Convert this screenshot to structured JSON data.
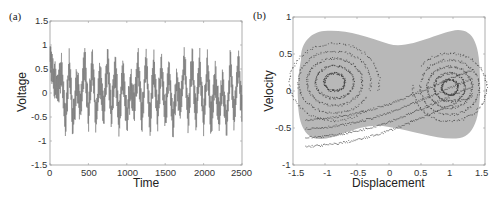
{
  "chart_data": [
    {
      "panel": "(a)",
      "type": "line",
      "title": "",
      "xlabel": "Time",
      "ylabel": "Voltage",
      "xlim": [
        0,
        2500
      ],
      "ylim": [
        -1.5,
        1.5
      ],
      "xticks": [
        "0",
        "500",
        "1000",
        "1500",
        "2000",
        "2500"
      ],
      "yticks": [
        "1.5",
        "1",
        "0.5",
        "0",
        "-0.5",
        "-1",
        "-1.5"
      ],
      "grid": false,
      "legend": null,
      "series": [
        {
          "name": "voltage",
          "color": "#555555",
          "values_are_representative": true,
          "description": "Dense chaotic oscillation, ~45 sharp spikes across 0–2500; values range roughly -0.9 to +0.95; initial transient near 1.0 at t≈0",
          "x": [
            0,
            50,
            100,
            150,
            200,
            250,
            300,
            350,
            400,
            450,
            500,
            550,
            600,
            650,
            700,
            750,
            800,
            850,
            900,
            950,
            1000,
            1050,
            1100,
            1150,
            1200,
            1250,
            1300,
            1350,
            1400,
            1450,
            1500,
            1550,
            1600,
            1650,
            1700,
            1750,
            1800,
            1850,
            1900,
            1950,
            2000,
            2050,
            2100,
            2150,
            2200,
            2250,
            2300,
            2350,
            2400,
            2450,
            2500
          ],
          "y": [
            1.0,
            0.4,
            0.1,
            0.7,
            -0.85,
            0.75,
            -0.8,
            0.3,
            -0.4,
            0.9,
            -0.6,
            0.8,
            -0.7,
            0.5,
            -0.5,
            0.85,
            -0.65,
            0.7,
            -0.8,
            0.6,
            -0.75,
            0.2,
            -0.3,
            0.8,
            -0.7,
            0.9,
            -0.85,
            0.75,
            -0.6,
            0.8,
            -0.7,
            0.6,
            -0.9,
            0.3,
            -0.4,
            0.95,
            -0.7,
            0.9,
            -0.65,
            0.8,
            -0.75,
            0.7,
            -0.8,
            0.5,
            -0.6,
            0.3,
            -0.9,
            0.8,
            -0.7,
            0.85,
            -0.5
          ]
        }
      ]
    },
    {
      "panel": "(b)",
      "type": "scatter",
      "title": "",
      "xlabel": "Displacement",
      "ylabel": "Velocity",
      "xlim": [
        -1.5,
        1.5
      ],
      "ylim": [
        -1,
        1
      ],
      "xticks": [
        "-1.5",
        "-1",
        "-0.5",
        "0",
        "0.5",
        "1",
        "1.5"
      ],
      "yticks": [
        "1",
        "0.5",
        "0",
        "-0.5",
        "-1"
      ],
      "grid": false,
      "legend": null,
      "series": [
        {
          "name": "trajectory-envelope",
          "color": "#b4b4b4",
          "values_are_representative": true,
          "description": "Light gray filled double-well (peanut-shaped) region spanning displacement ≈ -1.45 to 1.45, velocity ≈ -0.72 to 0.72, pinched near displacement 0 (≈ ±0.55)"
        },
        {
          "name": "poincare-points",
          "color": "#3a3a3a",
          "values_are_representative": true,
          "description": "Dark scattered points forming interleaved spiral/fold bands: left lobe centered near (-0.9, 0.15), right lobe near (0.9, -0.05), connected by an S-shaped band through (0, -0.15)"
        }
      ]
    }
  ],
  "panels": {
    "a": {
      "label": "(a)",
      "xlabel": "Time",
      "ylabel": "Voltage",
      "xticks": [
        "0",
        "500",
        "1000",
        "1500",
        "2000",
        "2500"
      ],
      "yticks": [
        "1.5",
        "1",
        "0.5",
        "0",
        "-0.5",
        "-1",
        "-1.5"
      ]
    },
    "b": {
      "label": "(b)",
      "xlabel": "Displacement",
      "ylabel": "Velocity",
      "xticks": [
        "-1.5",
        "-1",
        "-0.5",
        "0",
        "0.5",
        "1",
        "1.5"
      ],
      "yticks": [
        "1",
        "0.5",
        "0",
        "-0.5",
        "-1"
      ]
    }
  },
  "colors": {
    "axis": "#9a9a9a",
    "trace": "#555555",
    "envelope": "#b4b4b4",
    "points": "#3a3a3a"
  }
}
